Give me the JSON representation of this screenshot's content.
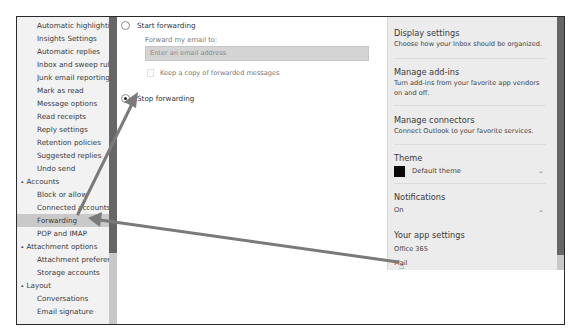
{
  "sidebar": {
    "items": [
      {
        "label": "Automatic highlighting",
        "type": "item"
      },
      {
        "label": "Insights Settings",
        "type": "item"
      },
      {
        "label": "Automatic replies",
        "type": "item"
      },
      {
        "label": "Inbox and sweep rules",
        "type": "item"
      },
      {
        "label": "Junk email reporting",
        "type": "item"
      },
      {
        "label": "Mark as read",
        "type": "item"
      },
      {
        "label": "Message options",
        "type": "item"
      },
      {
        "label": "Read receipts",
        "type": "item"
      },
      {
        "label": "Reply settings",
        "type": "item"
      },
      {
        "label": "Retention policies",
        "type": "item"
      },
      {
        "label": "Suggested replies",
        "type": "item"
      },
      {
        "label": "Undo send",
        "type": "item"
      },
      {
        "label": "Accounts",
        "type": "heading",
        "icon": "collapse-triangle-icon"
      },
      {
        "label": "Block or allow",
        "type": "item"
      },
      {
        "label": "Connected accounts",
        "type": "item"
      },
      {
        "label": "Forwarding",
        "type": "item",
        "selected": true
      },
      {
        "label": "POP and IMAP",
        "type": "item"
      },
      {
        "label": "Attachment options",
        "type": "heading",
        "icon": "collapse-triangle-icon"
      },
      {
        "label": "Attachment preferences",
        "type": "item"
      },
      {
        "label": "Storage accounts",
        "type": "item"
      },
      {
        "label": "Layout",
        "type": "heading",
        "icon": "collapse-triangle-icon"
      },
      {
        "label": "Conversations",
        "type": "item"
      },
      {
        "label": "Email signature",
        "type": "item"
      }
    ],
    "collapse_glyph": "▴"
  },
  "forwarding": {
    "start_label": "Start forwarding",
    "start_checked": false,
    "forward_to_label": "Forward my email to:",
    "email_placeholder": "Enter an email address",
    "keep_copy_label": "Keep a copy of forwarded messages",
    "keep_copy_checked": false,
    "stop_label": "Stop forwarding",
    "stop_checked": true
  },
  "right_panel": {
    "display_settings": {
      "title": "Display settings",
      "desc": "Choose how your Inbox should be organized."
    },
    "manage_addins": {
      "title": "Manage add-ins",
      "desc": "Turn add-ins from your favorite app vendors on and off."
    },
    "manage_connectors": {
      "title": "Manage connectors",
      "desc": "Connect Outlook to your favorite services."
    },
    "theme": {
      "title": "Theme",
      "value": "Default theme",
      "swatch_color": "#0a0a0a",
      "chevron": "⌄"
    },
    "notifications": {
      "title": "Notifications",
      "value": "On",
      "chevron": "⌄"
    },
    "app_settings": {
      "title": "Your app settings",
      "links": [
        "Office 365",
        "Mail"
      ]
    }
  },
  "annotations": {
    "arrow_color": "#7a7a7a",
    "cursor_glyph": "☝"
  }
}
